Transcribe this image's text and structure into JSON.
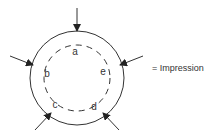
{
  "diagram": {
    "outer_circle": {
      "cx": 77,
      "cy": 78,
      "r": 47,
      "stroke": "#333333"
    },
    "inner_circle": {
      "cx": 77,
      "cy": 78,
      "r": 33,
      "stroke": "#333333",
      "dashed": true
    },
    "labels": [
      {
        "text": "a",
        "x": 75,
        "y": 52
      },
      {
        "text": "e",
        "x": 103,
        "y": 72
      },
      {
        "text": "d",
        "x": 94,
        "y": 107
      },
      {
        "text": "c",
        "x": 55,
        "y": 105
      },
      {
        "text": "b",
        "x": 47,
        "y": 74
      }
    ],
    "arrows": [
      {
        "name": "arrow-top",
        "x1": 77,
        "y1": 8,
        "x2": 77,
        "y2": 31
      },
      {
        "name": "arrow-left",
        "x1": 10,
        "y1": 56,
        "x2": 33,
        "y2": 65
      },
      {
        "name": "arrow-right",
        "x1": 143,
        "y1": 56,
        "x2": 120,
        "y2": 65
      },
      {
        "name": "arrow-bottom-left",
        "x1": 35,
        "y1": 130,
        "x2": 51,
        "y2": 113
      },
      {
        "name": "arrow-bottom-right",
        "x1": 119,
        "y1": 130,
        "x2": 103,
        "y2": 113
      }
    ]
  },
  "legend": {
    "text": "= Impression"
  }
}
